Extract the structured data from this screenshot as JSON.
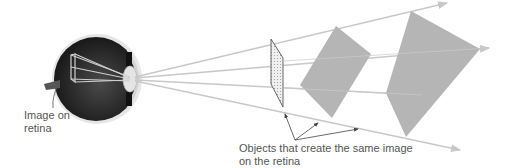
{
  "diagram": {
    "labels": {
      "image_on_retina": "Image on retina",
      "objects_same_image": "Objects that create the same image on the retina"
    },
    "colors": {
      "ray": "#c8c8c8",
      "shape_fill": "#b4b4b4",
      "eye_dark": "#2a2a2a",
      "eye_outline": "#d8d8d8",
      "lens": "#e8e8e8",
      "text": "#555555",
      "pointer": "#444444"
    },
    "objects": [
      {
        "name": "small-slanted-rectangle",
        "description": "small outlined hatched quadrilateral"
      },
      {
        "name": "medium-gray-quadrilateral",
        "description": "medium gray tilted rectangle"
      },
      {
        "name": "large-gray-quadrilateral",
        "description": "large gray kite-shaped quadrilateral"
      }
    ]
  }
}
